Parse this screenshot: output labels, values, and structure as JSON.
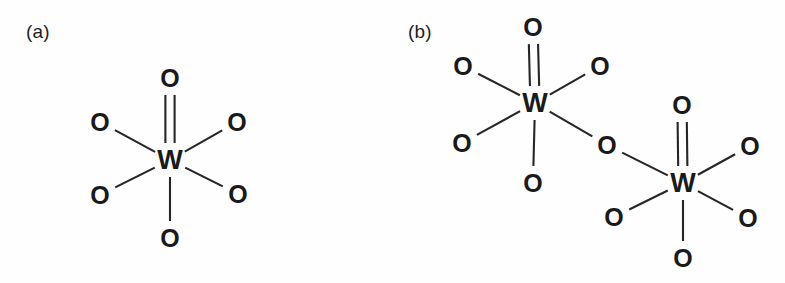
{
  "figure": {
    "background_color": "#fefefe",
    "line_color": "#262626",
    "text_color": "#1a1a1a",
    "width": 785,
    "height": 283
  },
  "panels": [
    {
      "id": "a",
      "label": "(a)",
      "structure_name": "mononuclear-tungsten-oxide",
      "atoms": [
        {
          "name": "metal-center",
          "element": "W",
          "x": 170,
          "y": 160
        },
        {
          "name": "oxo-top",
          "element": "O",
          "x": 170,
          "y": 78
        },
        {
          "name": "oxygen-upper-left",
          "element": "O",
          "x": 100,
          "y": 122
        },
        {
          "name": "oxygen-upper-right",
          "element": "O",
          "x": 237,
          "y": 122
        },
        {
          "name": "oxygen-lower-left",
          "element": "O",
          "x": 100,
          "y": 195
        },
        {
          "name": "oxygen-lower-right",
          "element": "O",
          "x": 238,
          "y": 194
        },
        {
          "name": "oxygen-bottom",
          "element": "O",
          "x": 170,
          "y": 238
        }
      ],
      "bonds": [
        {
          "name": "bond-w-oxo-top",
          "from": "metal-center",
          "to": "oxo-top",
          "order": 2
        },
        {
          "name": "bond-w-upper-left",
          "from": "metal-center",
          "to": "oxygen-upper-left",
          "order": 1
        },
        {
          "name": "bond-w-upper-right",
          "from": "metal-center",
          "to": "oxygen-upper-right",
          "order": 1
        },
        {
          "name": "bond-w-lower-left",
          "from": "metal-center",
          "to": "oxygen-lower-left",
          "order": 1
        },
        {
          "name": "bond-w-lower-right",
          "from": "metal-center",
          "to": "oxygen-lower-right",
          "order": 1
        },
        {
          "name": "bond-w-bottom",
          "from": "metal-center",
          "to": "oxygen-bottom",
          "order": 1
        }
      ]
    },
    {
      "id": "b",
      "label": "(b)",
      "structure_name": "binuclear-bridged-tungsten-oxide",
      "atoms": [
        {
          "name": "metal-center-left",
          "element": "W",
          "x": 143,
          "y": 103
        },
        {
          "name": "oxo-top-left",
          "element": "O",
          "x": 141,
          "y": 27
        },
        {
          "name": "oxygen-upper-left-1",
          "element": "O",
          "x": 71,
          "y": 66
        },
        {
          "name": "oxygen-upper-right-1",
          "element": "O",
          "x": 208,
          "y": 66
        },
        {
          "name": "oxygen-lower-left-1",
          "element": "O",
          "x": 70,
          "y": 143
        },
        {
          "name": "oxygen-bottom-1",
          "element": "O",
          "x": 141,
          "y": 183
        },
        {
          "name": "bridging-oxygen",
          "element": "O",
          "x": 215,
          "y": 145
        },
        {
          "name": "metal-center-right",
          "element": "W",
          "x": 291,
          "y": 183
        },
        {
          "name": "oxo-top-right",
          "element": "O",
          "x": 290,
          "y": 105
        },
        {
          "name": "oxygen-upper-right-2",
          "element": "O",
          "x": 358,
          "y": 146
        },
        {
          "name": "oxygen-lower-left-2",
          "element": "O",
          "x": 222,
          "y": 217
        },
        {
          "name": "oxygen-lower-right-2",
          "element": "O",
          "x": 356,
          "y": 218
        },
        {
          "name": "oxygen-bottom-2",
          "element": "O",
          "x": 291,
          "y": 258
        }
      ],
      "bonds": [
        {
          "name": "bond-wl-oxo-top",
          "from": "metal-center-left",
          "to": "oxo-top-left",
          "order": 2
        },
        {
          "name": "bond-wl-upper-left",
          "from": "metal-center-left",
          "to": "oxygen-upper-left-1",
          "order": 1
        },
        {
          "name": "bond-wl-upper-right",
          "from": "metal-center-left",
          "to": "oxygen-upper-right-1",
          "order": 1
        },
        {
          "name": "bond-wl-lower-left",
          "from": "metal-center-left",
          "to": "oxygen-lower-left-1",
          "order": 1
        },
        {
          "name": "bond-wl-bottom",
          "from": "metal-center-left",
          "to": "oxygen-bottom-1",
          "order": 1
        },
        {
          "name": "bond-wl-bridge",
          "from": "metal-center-left",
          "to": "bridging-oxygen",
          "order": 1
        },
        {
          "name": "bond-bridge-wr",
          "from": "bridging-oxygen",
          "to": "metal-center-right",
          "order": 1
        },
        {
          "name": "bond-wr-oxo-top",
          "from": "metal-center-right",
          "to": "oxo-top-right",
          "order": 2
        },
        {
          "name": "bond-wr-upper-right",
          "from": "metal-center-right",
          "to": "oxygen-upper-right-2",
          "order": 1
        },
        {
          "name": "bond-wr-lower-left",
          "from": "metal-center-right",
          "to": "oxygen-lower-left-2",
          "order": 1
        },
        {
          "name": "bond-wr-lower-right",
          "from": "metal-center-right",
          "to": "oxygen-lower-right-2",
          "order": 1
        },
        {
          "name": "bond-wr-bottom",
          "from": "metal-center-right",
          "to": "oxygen-bottom-2",
          "order": 1
        }
      ]
    }
  ]
}
